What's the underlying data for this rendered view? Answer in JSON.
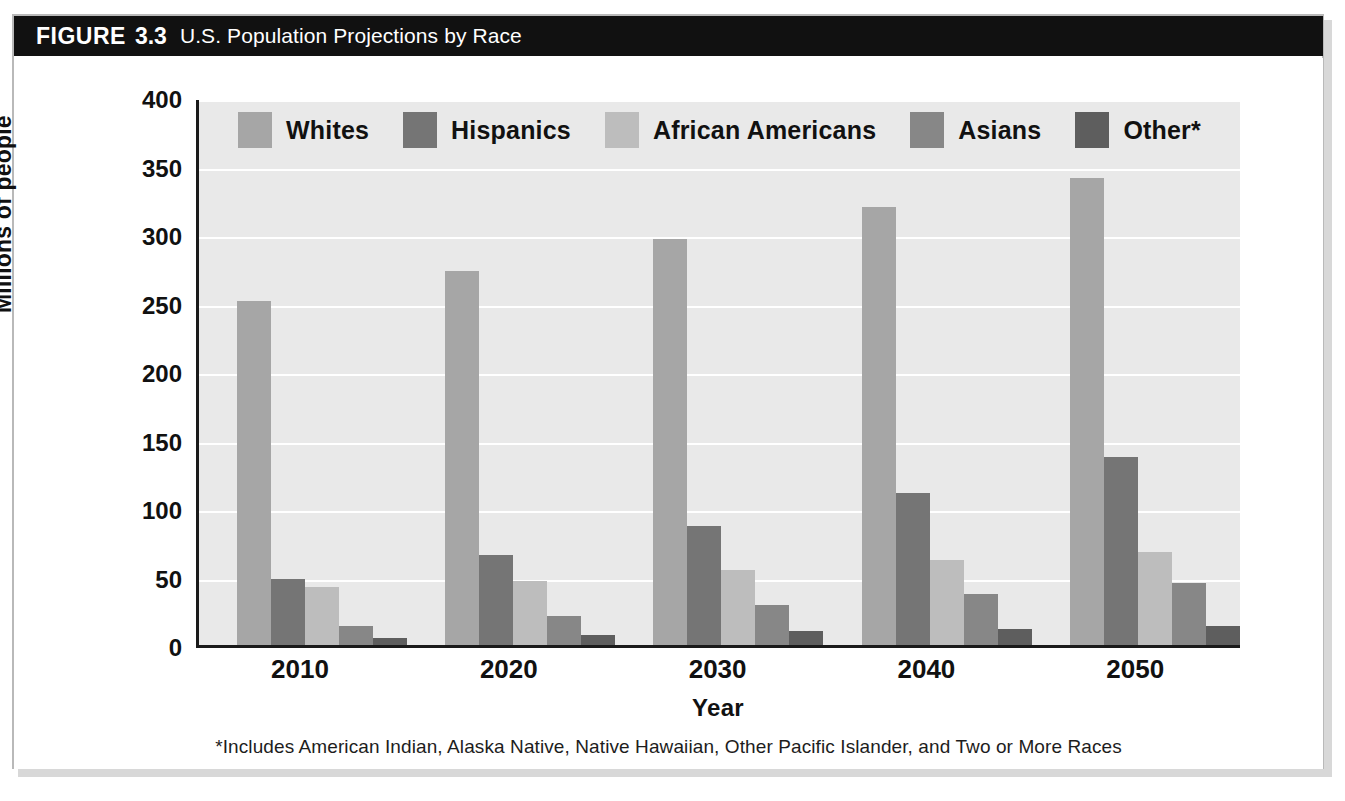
{
  "figure": {
    "label": "FIGURE",
    "number": "3.3",
    "caption": "U.S. Population Projections by Race",
    "footnote": "*Includes American Indian, Alaska Native, Native Hawaiian, Other Pacific Islander, and Two or More Races"
  },
  "colors": {
    "banner_background": "#111111",
    "banner_text": "#ffffff",
    "plot_background": "#e9e9e9",
    "gridline": "#ffffff",
    "axis": "#1a1a1a",
    "frame_border": "#b9b9b9",
    "page_background": "#ffffff",
    "whites": "#a6a6a6",
    "hispanics": "#757575",
    "african_americans": "#bdbdbd",
    "asians": "#878787",
    "other": "#5e5e5e"
  },
  "chart_data": {
    "type": "bar",
    "title": "U.S. Population Projections by Race",
    "xlabel": "Year",
    "ylabel": "Millions of people",
    "ylim": [
      0,
      400
    ],
    "ytick_step": 50,
    "yticks": [
      "400",
      "350",
      "300",
      "250",
      "200",
      "150",
      "100",
      "50",
      "0"
    ],
    "ytick_values": [
      400,
      350,
      300,
      250,
      200,
      150,
      100,
      50,
      0
    ],
    "grid": true,
    "grid_axis": "y",
    "legend_position": "top",
    "categories": [
      "2010",
      "2020",
      "2030",
      "2040",
      "2050"
    ],
    "series": [
      {
        "name": "Whites",
        "color": "#a6a6a6",
        "values": [
          251,
          273,
          296,
          320,
          341
        ]
      },
      {
        "name": "Hispanics",
        "color": "#757575",
        "values": [
          48,
          66,
          87,
          111,
          137
        ]
      },
      {
        "name": "African Americans",
        "color": "#bdbdbd",
        "values": [
          42,
          47,
          55,
          62,
          68
        ]
      },
      {
        "name": "Asians",
        "color": "#878787",
        "values": [
          14,
          21,
          29,
          37,
          45
        ]
      },
      {
        "name": "Other*",
        "color": "#5e5e5e",
        "values": [
          5,
          7,
          10,
          12,
          14
        ]
      }
    ],
    "annotations": [
      "*Includes American Indian, Alaska Native, Native Hawaiian, Other Pacific Islander, and Two or More Races"
    ]
  }
}
